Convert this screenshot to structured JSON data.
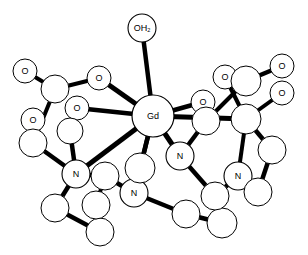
{
  "figure": {
    "name": "gadolinium-chelate-structure",
    "caption": "",
    "background_color": "#ffffff",
    "line_color": "#000000",
    "atom_fill": "#ffffff"
  },
  "chart_data": {
    "type": "diagram",
    "title": "",
    "subtitle": "",
    "xlabel": "",
    "ylabel": "",
    "legend": [],
    "annotations": [],
    "atoms": [
      {
        "id": "Gd",
        "label": "Gd",
        "x": 153,
        "y": 116,
        "r": 21,
        "stroke": 1.2,
        "font": 10,
        "kind": "metal"
      },
      {
        "id": "OW",
        "label": "OH2",
        "x": 142,
        "y": 28,
        "r": 14,
        "stroke": 1.1,
        "font": 8,
        "kind": "water"
      },
      {
        "id": "O1",
        "label": "O",
        "x": 25,
        "y": 71,
        "r": 12,
        "stroke": 1.0,
        "font": 8,
        "kind": "oxygen"
      },
      {
        "id": "O2",
        "label": "O",
        "x": 99,
        "y": 78,
        "r": 12,
        "stroke": 1.0,
        "font": 8,
        "kind": "oxygen"
      },
      {
        "id": "O3",
        "label": "O",
        "x": 77,
        "y": 108,
        "r": 12,
        "stroke": 1.0,
        "font": 8,
        "kind": "oxygen"
      },
      {
        "id": "O4",
        "label": "O",
        "x": 33,
        "y": 120,
        "r": 12,
        "stroke": 1.0,
        "font": 8,
        "kind": "oxygen"
      },
      {
        "id": "O5",
        "label": "O",
        "x": 225,
        "y": 77,
        "r": 12,
        "stroke": 1.0,
        "font": 8,
        "kind": "oxygen"
      },
      {
        "id": "O6",
        "label": "O",
        "x": 282,
        "y": 66,
        "r": 12,
        "stroke": 1.0,
        "font": 8,
        "kind": "oxygen"
      },
      {
        "id": "O7",
        "label": "O",
        "x": 282,
        "y": 93,
        "r": 12,
        "stroke": 1.0,
        "font": 8,
        "kind": "oxygen"
      },
      {
        "id": "O8",
        "label": "O",
        "x": 203,
        "y": 102,
        "r": 12,
        "stroke": 1.0,
        "font": 8,
        "kind": "oxygen"
      },
      {
        "id": "N1",
        "label": "N",
        "x": 76,
        "y": 174,
        "r": 14,
        "stroke": 1.1,
        "font": 9,
        "kind": "nitrogen"
      },
      {
        "id": "N2",
        "label": "N",
        "x": 134,
        "y": 193,
        "r": 14,
        "stroke": 1.1,
        "font": 9,
        "kind": "nitrogen"
      },
      {
        "id": "N3",
        "label": "N",
        "x": 180,
        "y": 156,
        "r": 14,
        "stroke": 1.1,
        "font": 9,
        "kind": "nitrogen"
      },
      {
        "id": "N4",
        "label": "N",
        "x": 238,
        "y": 176,
        "r": 14,
        "stroke": 1.1,
        "font": 9,
        "kind": "nitrogen"
      },
      {
        "id": "C1",
        "label": "",
        "x": 55,
        "y": 89,
        "r": 14,
        "stroke": 1.0,
        "font": 8,
        "kind": "carbon"
      },
      {
        "id": "C2",
        "label": "",
        "x": 70,
        "y": 131,
        "r": 13,
        "stroke": 1.0,
        "font": 8,
        "kind": "carbon"
      },
      {
        "id": "C3",
        "label": "",
        "x": 33,
        "y": 143,
        "r": 14,
        "stroke": 1.0,
        "font": 8,
        "kind": "carbon"
      },
      {
        "id": "C4",
        "label": "",
        "x": 55,
        "y": 208,
        "r": 14,
        "stroke": 1.0,
        "font": 8,
        "kind": "carbon"
      },
      {
        "id": "C5",
        "label": "",
        "x": 100,
        "y": 232,
        "r": 14,
        "stroke": 1.0,
        "font": 8,
        "kind": "carbon"
      },
      {
        "id": "C6",
        "label": "",
        "x": 96,
        "y": 205,
        "r": 14,
        "stroke": 1.0,
        "font": 8,
        "kind": "carbon"
      },
      {
        "id": "C7",
        "label": "",
        "x": 105,
        "y": 176,
        "r": 14,
        "stroke": 1.0,
        "font": 8,
        "kind": "carbon"
      },
      {
        "id": "C8",
        "label": "",
        "x": 140,
        "y": 168,
        "r": 15,
        "stroke": 1.0,
        "font": 8,
        "kind": "carbon"
      },
      {
        "id": "C9",
        "label": "",
        "x": 186,
        "y": 214,
        "r": 14,
        "stroke": 1.0,
        "font": 8,
        "kind": "carbon"
      },
      {
        "id": "C10",
        "label": "",
        "x": 222,
        "y": 223,
        "r": 15,
        "stroke": 1.0,
        "font": 8,
        "kind": "carbon"
      },
      {
        "id": "C11",
        "label": "",
        "x": 215,
        "y": 196,
        "r": 14,
        "stroke": 1.0,
        "font": 8,
        "kind": "carbon"
      },
      {
        "id": "C12",
        "label": "",
        "x": 258,
        "y": 192,
        "r": 14,
        "stroke": 1.0,
        "font": 8,
        "kind": "carbon"
      },
      {
        "id": "C13",
        "label": "",
        "x": 272,
        "y": 150,
        "r": 14,
        "stroke": 1.0,
        "font": 8,
        "kind": "carbon"
      },
      {
        "id": "C14",
        "label": "",
        "x": 246,
        "y": 119,
        "r": 15,
        "stroke": 1.0,
        "font": 8,
        "kind": "carbon"
      },
      {
        "id": "C15",
        "label": "",
        "x": 246,
        "y": 81,
        "r": 15,
        "stroke": 1.0,
        "font": 8,
        "kind": "carbon"
      },
      {
        "id": "C16",
        "label": "",
        "x": 206,
        "y": 121,
        "r": 14,
        "stroke": 1.0,
        "font": 8,
        "kind": "carbon"
      }
    ],
    "bonds": [
      {
        "from": "Gd",
        "to": "OW",
        "width": 4.5
      },
      {
        "from": "Gd",
        "to": "O2",
        "width": 5.0
      },
      {
        "from": "Gd",
        "to": "O3",
        "width": 4.5
      },
      {
        "from": "Gd",
        "to": "O8",
        "width": 4.5
      },
      {
        "from": "Gd",
        "to": "C14",
        "width": 5.0
      },
      {
        "from": "Gd",
        "to": "N1",
        "width": 5.0
      },
      {
        "from": "Gd",
        "to": "N2",
        "width": 4.5
      },
      {
        "from": "Gd",
        "to": "N3",
        "width": 5.0
      },
      {
        "from": "Gd",
        "to": "C8",
        "width": 4.5
      },
      {
        "from": "O1",
        "to": "C1",
        "width": 4.0
      },
      {
        "from": "C1",
        "to": "O2",
        "width": 4.0
      },
      {
        "from": "C1",
        "to": "C3",
        "width": 4.0
      },
      {
        "from": "O4",
        "to": "C3",
        "width": 4.0
      },
      {
        "from": "O3",
        "to": "C2",
        "width": 4.0
      },
      {
        "from": "C2",
        "to": "N1",
        "width": 4.5
      },
      {
        "from": "C3",
        "to": "N1",
        "width": 4.5
      },
      {
        "from": "N1",
        "to": "C4",
        "width": 4.5
      },
      {
        "from": "C4",
        "to": "C5",
        "width": 4.5
      },
      {
        "from": "C5",
        "to": "C6",
        "width": 4.5
      },
      {
        "from": "C6",
        "to": "C7",
        "width": 4.0
      },
      {
        "from": "N1",
        "to": "C7",
        "width": 4.5
      },
      {
        "from": "C7",
        "to": "N2",
        "width": 4.5
      },
      {
        "from": "N2",
        "to": "C8",
        "width": 4.5
      },
      {
        "from": "N2",
        "to": "C9",
        "width": 4.5
      },
      {
        "from": "C9",
        "to": "C10",
        "width": 4.5
      },
      {
        "from": "C10",
        "to": "C11",
        "width": 4.5
      },
      {
        "from": "C11",
        "to": "N4",
        "width": 4.5
      },
      {
        "from": "N3",
        "to": "C11",
        "width": 4.5
      },
      {
        "from": "N4",
        "to": "C12",
        "width": 4.0
      },
      {
        "from": "C12",
        "to": "C13",
        "width": 4.5
      },
      {
        "from": "C13",
        "to": "C14",
        "width": 4.5
      },
      {
        "from": "N3",
        "to": "C16",
        "width": 4.5
      },
      {
        "from": "C16",
        "to": "C15",
        "width": 4.0
      },
      {
        "from": "O8",
        "to": "C16",
        "width": 4.0
      },
      {
        "from": "C15",
        "to": "O5",
        "width": 4.0
      },
      {
        "from": "C15",
        "to": "O6",
        "width": 4.5
      },
      {
        "from": "O5",
        "to": "C14",
        "width": 4.0
      },
      {
        "from": "C14",
        "to": "O7",
        "width": 4.0
      },
      {
        "from": "N4",
        "to": "C14",
        "width": 4.0
      }
    ]
  }
}
